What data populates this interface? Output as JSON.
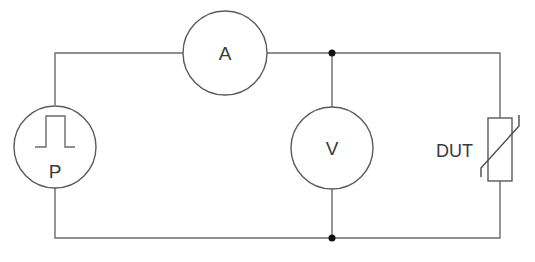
{
  "diagram": {
    "type": "circuit-schematic",
    "colors": {
      "wire": "#6b6b6b",
      "component_outline": "#5a5a5a",
      "junction": "#111111",
      "text": "#3a3a3a",
      "background": "#ffffff"
    },
    "components": {
      "pulse_source": {
        "label": "P",
        "symbol": "circle-with-square-pulse"
      },
      "ammeter": {
        "label": "A",
        "symbol": "circle"
      },
      "voltmeter": {
        "label": "V",
        "symbol": "circle"
      },
      "dut": {
        "label": "DUT",
        "symbol": "varistor-rectangle-with-diagonal"
      }
    },
    "junctions": [
      {
        "name": "top-node",
        "x": 332,
        "y": 53
      },
      {
        "name": "bottom-node",
        "x": 332,
        "y": 238
      }
    ]
  }
}
